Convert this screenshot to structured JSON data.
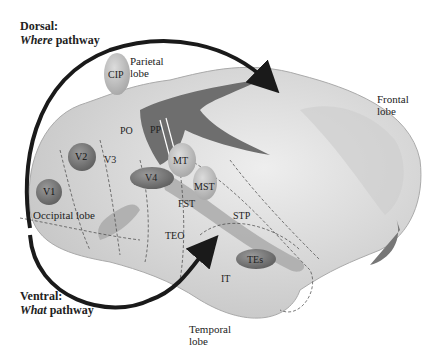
{
  "pathways": {
    "dorsal": {
      "title": "Dorsal:",
      "italic": "Where",
      "rest": " pathway"
    },
    "ventral": {
      "title": "Ventral:",
      "italic": "What",
      "rest": " pathway"
    }
  },
  "lobes": {
    "parietal": [
      "Parietal",
      "lobe"
    ],
    "frontal": [
      "Frontal",
      "lobe"
    ],
    "occipital": "Occipital lobe",
    "temporal": [
      "Temporal",
      "lobe"
    ]
  },
  "areas": {
    "cip": "CIP",
    "po": "PO",
    "pp": "PP",
    "v1": "V1",
    "v2": "V2",
    "v3": "V3",
    "v4": "V4",
    "mt": "MT",
    "mst": "MST",
    "fst": "FST",
    "stp": "STP",
    "teo": "TEO",
    "tes": "TEs",
    "it": "IT"
  },
  "colors": {
    "dark_region": "#6e6e6e",
    "medium_region": "#a8a8a8",
    "brain": "#d9d9d9",
    "arrow": "#1a1a1a"
  }
}
